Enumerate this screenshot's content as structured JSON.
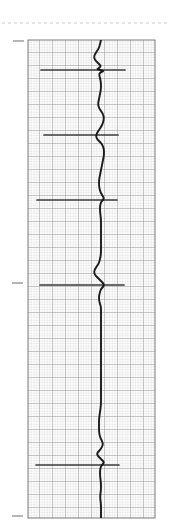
{
  "page": {
    "background_color": "#ffffff",
    "width": 171,
    "height": 530
  },
  "chart_data": {
    "type": "line",
    "orientation": "vertical",
    "title": "",
    "subtitle": "",
    "xlabel": "",
    "ylabel": "",
    "grid": true,
    "legend": null,
    "plot_area": {
      "x": 28,
      "y": 40,
      "width": 127,
      "height": 478,
      "baseline_x": 101,
      "paper_color": "#fdfdfd",
      "minor_grid_color": "#c9c9c9",
      "major_grid_color": "#8a8a8a",
      "border_color": "#6e6e6e",
      "minor_step": 2.6,
      "major_step": 13
    },
    "trace": {
      "color": "#1b1b1b",
      "width": 1.9,
      "xlim": [
        28,
        155
      ],
      "ylim": [
        40,
        518
      ],
      "points": [
        [
          101,
          40
        ],
        [
          100,
          44
        ],
        [
          99,
          48
        ],
        [
          97,
          51
        ],
        [
          95,
          54
        ],
        [
          94,
          57
        ],
        [
          95,
          60
        ],
        [
          97,
          62
        ],
        [
          99,
          64
        ],
        [
          101,
          66
        ],
        [
          99,
          68
        ],
        [
          97,
          69
        ],
        [
          100,
          70
        ],
        [
          104,
          71
        ],
        [
          101,
          72
        ],
        [
          99,
          74
        ],
        [
          100,
          78
        ],
        [
          101,
          83
        ],
        [
          101,
          89
        ],
        [
          100,
          94
        ],
        [
          99,
          99
        ],
        [
          98,
          104
        ],
        [
          99,
          108
        ],
        [
          101,
          111
        ],
        [
          103,
          114
        ],
        [
          104,
          118
        ],
        [
          103,
          123
        ],
        [
          101,
          127
        ],
        [
          99,
          130
        ],
        [
          97,
          133
        ],
        [
          96,
          136
        ],
        [
          97,
          139
        ],
        [
          99,
          141
        ],
        [
          101,
          143
        ],
        [
          103,
          146
        ],
        [
          104,
          150
        ],
        [
          104,
          155
        ],
        [
          103,
          160
        ],
        [
          102,
          165
        ],
        [
          101,
          170
        ],
        [
          100,
          175
        ],
        [
          99,
          180
        ],
        [
          99,
          186
        ],
        [
          100,
          191
        ],
        [
          102,
          195
        ],
        [
          104,
          198
        ],
        [
          103,
          200
        ],
        [
          101,
          202
        ],
        [
          100,
          206
        ],
        [
          100,
          212
        ],
        [
          101,
          219
        ],
        [
          101,
          226
        ],
        [
          101,
          233
        ],
        [
          101,
          240
        ],
        [
          101,
          247
        ],
        [
          101,
          254
        ],
        [
          100,
          259
        ],
        [
          99,
          263
        ],
        [
          97,
          266
        ],
        [
          95,
          269
        ],
        [
          94,
          272
        ],
        [
          95,
          275
        ],
        [
          97,
          277
        ],
        [
          99,
          279
        ],
        [
          101,
          281
        ],
        [
          103,
          283
        ],
        [
          104,
          285
        ],
        [
          103,
          287
        ],
        [
          101,
          289
        ],
        [
          100,
          292
        ],
        [
          99,
          296
        ],
        [
          99,
          300
        ],
        [
          100,
          304
        ],
        [
          101,
          307
        ],
        [
          101,
          312
        ],
        [
          101,
          318
        ],
        [
          101,
          325
        ],
        [
          101,
          333
        ],
        [
          101,
          341
        ],
        [
          101,
          349
        ],
        [
          101,
          357
        ],
        [
          101,
          365
        ],
        [
          101,
          373
        ],
        [
          101,
          381
        ],
        [
          101,
          389
        ],
        [
          101,
          397
        ],
        [
          101,
          405
        ],
        [
          100,
          412
        ],
        [
          99,
          419
        ],
        [
          99,
          426
        ],
        [
          99,
          432
        ],
        [
          100,
          437
        ],
        [
          102,
          441
        ],
        [
          103,
          444
        ],
        [
          102,
          447
        ],
        [
          100,
          450
        ],
        [
          98,
          452
        ],
        [
          97,
          454
        ],
        [
          98,
          456
        ],
        [
          100,
          458
        ],
        [
          102,
          460
        ],
        [
          104,
          462
        ],
        [
          103,
          464
        ],
        [
          101,
          466
        ],
        [
          100,
          470
        ],
        [
          100,
          476
        ],
        [
          101,
          483
        ],
        [
          101,
          490
        ],
        [
          100,
          497
        ],
        [
          101,
          504
        ],
        [
          101,
          511
        ],
        [
          101,
          518
        ]
      ]
    },
    "event_lines": [
      {
        "label": "event-marker-1",
        "y": 70,
        "x_start": 41,
        "x_end": 125,
        "color": "#3a3a3a",
        "thickness": 1.7
      },
      {
        "label": "event-marker-2",
        "y": 135,
        "x_start": 44,
        "x_end": 118,
        "color": "#3a3a3a",
        "thickness": 1.7
      },
      {
        "label": "event-marker-3",
        "y": 200,
        "x_start": 37,
        "x_end": 117,
        "color": "#3a3a3a",
        "thickness": 1.7
      },
      {
        "label": "event-marker-4",
        "y": 285,
        "x_start": 40,
        "x_end": 124,
        "color": "#3a3a3a",
        "thickness": 1.7
      },
      {
        "label": "event-marker-5",
        "y": 465,
        "x_start": 36,
        "x_end": 119,
        "color": "#3a3a3a",
        "thickness": 1.7
      }
    ],
    "margin_ticks": [
      {
        "label": "margin-tick-top",
        "y": 41,
        "x_start": 13,
        "x_end": 24,
        "color": "#7a7a7a"
      },
      {
        "label": "margin-tick-middle",
        "y": 283,
        "x_start": 12,
        "x_end": 23,
        "color": "#7a7a7a"
      },
      {
        "label": "margin-tick-bottom",
        "y": 516,
        "x_start": 12,
        "x_end": 23,
        "color": "#7a7a7a"
      }
    ],
    "dashed_rule": {
      "label": "dashed-separator",
      "y": 23,
      "x_start": 2,
      "x_end": 169,
      "color": "#c2c2c2",
      "dash": "3 3"
    }
  }
}
